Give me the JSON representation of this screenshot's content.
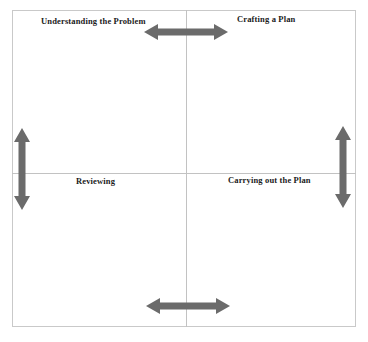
{
  "diagram": {
    "type": "2x2-matrix-with-bidirectional-arrows",
    "frame_color": "#c9c9c9",
    "divider_color": "#c2c2c2",
    "arrow_color": "#6b6b6b",
    "background_color": "#ffffff",
    "quadrants": [
      {
        "id": "top-left",
        "label": "Understanding the Problem"
      },
      {
        "id": "top-right",
        "label": "Crafting a Plan"
      },
      {
        "id": "bottom-left",
        "label": "Reviewing"
      },
      {
        "id": "bottom-right",
        "label": "Carrying out the Plan"
      }
    ],
    "arrows": [
      {
        "id": "top",
        "orientation": "horizontal",
        "heads": "double",
        "name": "double-arrow-horizontal-top-icon"
      },
      {
        "id": "bottom",
        "orientation": "horizontal",
        "heads": "double",
        "name": "double-arrow-horizontal-bottom-icon"
      },
      {
        "id": "left",
        "orientation": "vertical",
        "heads": "double",
        "name": "double-arrow-vertical-left-icon"
      },
      {
        "id": "right",
        "orientation": "vertical",
        "heads": "double",
        "name": "double-arrow-vertical-right-icon"
      }
    ]
  }
}
